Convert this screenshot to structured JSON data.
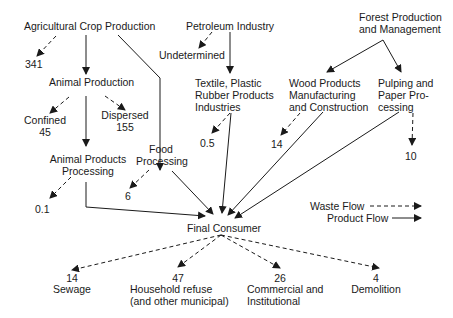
{
  "diagram": {
    "sources": {
      "agri": "Agricultural Crop Production",
      "petro": "Petroleum Industry",
      "forest": "Forest Production\nand Management"
    },
    "intermediates": {
      "animal": "Animal Production",
      "undetermined": "Undetermined",
      "textile": "Textile, Plastic\nRubber Products\nIndustries",
      "wood": "Wood Products\nManufacturing\nand Construction",
      "pulp": "Pulping and\nPaper Pro-\ncessing",
      "confined": "Confined",
      "dispersed": "Dispersed",
      "food": "Food\nProcessing",
      "animal_products": "Animal Products\nProcessing",
      "final": "Final Consumer"
    },
    "values": {
      "agri_waste": "341",
      "confined": "45",
      "dispersed": "155",
      "textile_waste": "0.5",
      "wood_waste": "14",
      "pulp_waste": "10",
      "food_waste": "6",
      "animal_products_waste": "0.1"
    },
    "outputs": [
      {
        "value": "14",
        "label": "Sewage"
      },
      {
        "value": "47",
        "label": "Household refuse\n(and other municipal)"
      },
      {
        "value": "26",
        "label": "Commercial and\nInstitutional"
      },
      {
        "value": "4",
        "label": "Demolition"
      }
    ],
    "legend": {
      "waste": "Waste Flow",
      "product": "Product Flow"
    }
  }
}
